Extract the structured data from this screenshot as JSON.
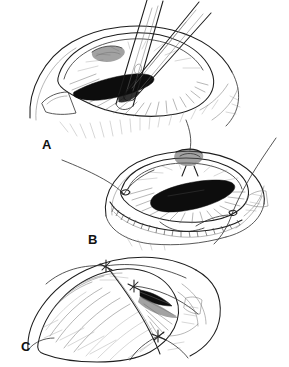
{
  "figure": {
    "background_color": "#ffffff",
    "ink_color": "#3b3b3b",
    "style": "pen-and-ink line drawing"
  },
  "panels": [
    {
      "id": "a",
      "label": "A",
      "caption": "",
      "description": "Eye globe with limbal incision opened; two-bladed forceps grasping tissue at the pupil; dark elliptical pupil visible beneath the instrument; radial iris striations around pupil; scleral curve and rectangular retractor at lower left.",
      "elements": [
        "globe-outline",
        "limbal-incision",
        "iris-striations",
        "dark-pupil",
        "forceps-upper-blade",
        "forceps-lower-blade",
        "retractor",
        "sclera-hatching"
      ]
    },
    {
      "id": "b",
      "label": "B",
      "caption": "",
      "description": "Eye globe with dark elongated pupil; suture knot placed centrally at the wound; long suture threads extending to upper left, top and right; beaded stippled limbal wound edge along the lower margin; radial iris striations.",
      "elements": [
        "globe-outline",
        "dark-pupil",
        "central-suture-knot",
        "suture-thread-left",
        "suture-thread-top",
        "suture-thread-right",
        "beaded-wound-edge",
        "iris-striations"
      ]
    },
    {
      "id": "c",
      "label": "C",
      "caption": "",
      "description": "Closed conjunctival flap drawn over the globe with sketchy hatching texture; three tied suture knots along the curved incision line; dark shaded wedge of exposed tissue at the right of the flap.",
      "elements": [
        "conjunctival-flap",
        "flap-hatching",
        "incision-line",
        "suture-knot-1",
        "suture-knot-2",
        "suture-knot-3",
        "dark-wedge",
        "globe-outline"
      ]
    }
  ]
}
